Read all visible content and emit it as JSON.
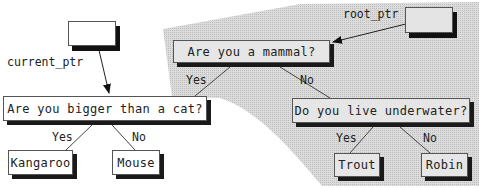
{
  "diagram": {
    "type": "binary-decision-tree",
    "colors": {
      "subtree_shading": "#d2d2d2",
      "node_fill": "#ffffff",
      "shaded_node_fill": "#e6e6e6",
      "shadow": "#1a1a1a",
      "line": "#444444"
    },
    "pointers": {
      "current_ptr": {
        "label": "current_ptr",
        "points_to": "bigger"
      },
      "root_ptr": {
        "label": "root_ptr",
        "points_to": "mammal"
      }
    },
    "nodes": {
      "mammal": {
        "text": "Are you a mammal?",
        "shaded": true
      },
      "bigger": {
        "text": "Are you bigger than a cat?",
        "shaded": false
      },
      "underwater": {
        "text": "Do you live underwater?",
        "shaded": true
      },
      "kangaroo": {
        "text": "Kangaroo",
        "shaded": false
      },
      "mouse": {
        "text": "Mouse",
        "shaded": false
      },
      "trout": {
        "text": "Trout",
        "shaded": true
      },
      "robin": {
        "text": "Robin",
        "shaded": true
      }
    },
    "edges": [
      {
        "from": "mammal",
        "to": "bigger",
        "label": "Yes"
      },
      {
        "from": "mammal",
        "to": "underwater",
        "label": "No"
      },
      {
        "from": "bigger",
        "to": "kangaroo",
        "label": "Yes"
      },
      {
        "from": "bigger",
        "to": "mouse",
        "label": "No"
      },
      {
        "from": "underwater",
        "to": "trout",
        "label": "Yes"
      },
      {
        "from": "underwater",
        "to": "robin",
        "label": "No"
      }
    ]
  }
}
